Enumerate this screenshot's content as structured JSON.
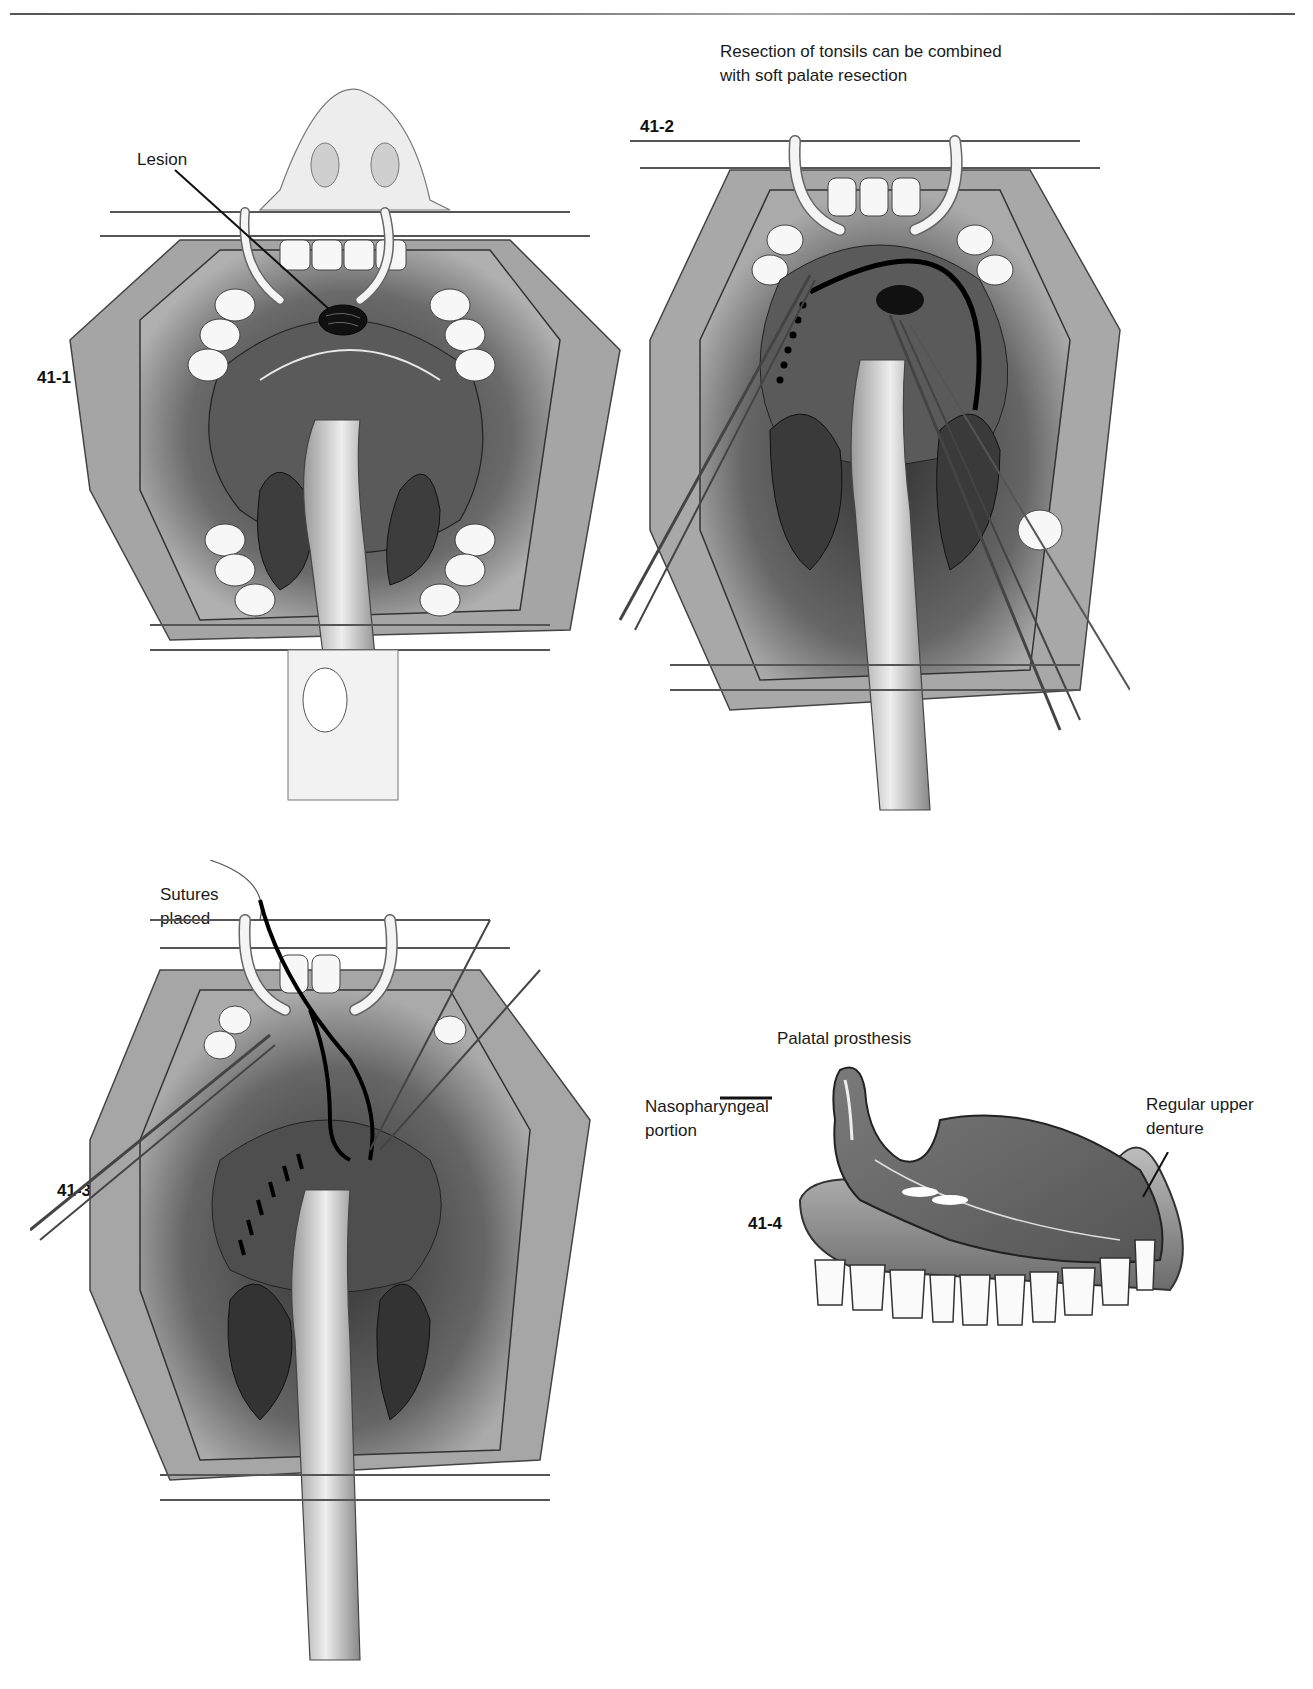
{
  "page": {
    "header_rule": true
  },
  "figures": [
    {
      "id": "41-1",
      "label": "41-1",
      "callouts": [
        {
          "text": "Lesion"
        }
      ]
    },
    {
      "id": "41-2",
      "label": "41-2",
      "caption": [
        "Resection of tonsils can be combined",
        "with soft palate resection"
      ]
    },
    {
      "id": "41-3",
      "label": "41-3",
      "callouts": [
        {
          "line1": "Sutures",
          "line2": "placed"
        }
      ]
    },
    {
      "id": "41-4",
      "label": "41-4",
      "title": "Palatal prosthesis",
      "callouts": [
        {
          "line1": "Nasopharyngeal",
          "line2": "portion"
        },
        {
          "line1": "Regular upper",
          "line2": "denture"
        }
      ]
    }
  ],
  "colors": {
    "ink": "#1a1a1a",
    "tissue_dark": "#4a4a4a",
    "tissue_mid": "#8a8a8a",
    "tissue_light": "#c8c8c8",
    "paper": "#ffffff"
  }
}
